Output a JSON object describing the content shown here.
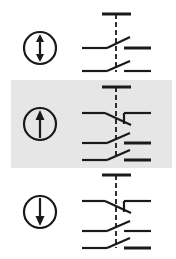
{
  "diagram": {
    "title": "",
    "colors": {
      "stroke": "#1a1a1a",
      "highlight_band": "#e6e6e6",
      "background": "#ffffff"
    },
    "rows": [
      {
        "id": "row-1",
        "icon": "up-down-arrow-icon",
        "direction": "bidirectional",
        "highlighted": false,
        "contacts": [
          "normally-open",
          "normally-open"
        ]
      },
      {
        "id": "row-2",
        "icon": "up-arrow-icon",
        "direction": "up",
        "highlighted": true,
        "contacts": [
          "normally-closed",
          "normally-open",
          "normally-open"
        ]
      },
      {
        "id": "row-3",
        "icon": "down-arrow-icon",
        "direction": "down",
        "highlighted": false,
        "contacts": [
          "normally-closed",
          "normally-open",
          "normally-open"
        ]
      }
    ]
  }
}
